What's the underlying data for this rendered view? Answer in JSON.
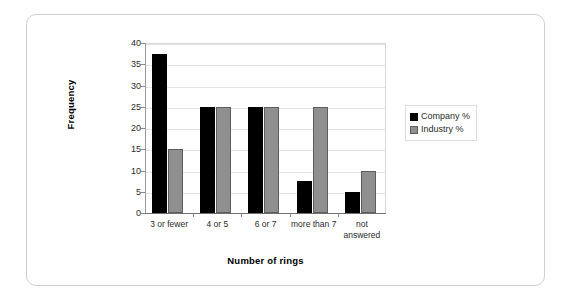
{
  "chart_data": {
    "type": "bar",
    "title": "",
    "xlabel": "Number of rings",
    "ylabel": "Frequency",
    "categories": [
      "3 or fewer",
      "4 or 5",
      "6 or 7",
      "more than 7",
      "not answered"
    ],
    "series": [
      {
        "name": "Company %",
        "color": "#000000",
        "values": [
          37.5,
          25,
          25,
          7.5,
          5
        ]
      },
      {
        "name": "Industry %",
        "color": "#8f8f8f",
        "values": [
          15,
          25,
          25,
          25,
          10
        ]
      }
    ],
    "ylim": [
      0,
      40
    ],
    "ytick_step": 5,
    "ytick_labels": [
      "0",
      "5",
      "10",
      "15",
      "20",
      "25",
      "30",
      "35",
      "40"
    ],
    "grid": true,
    "legend_position": "right"
  },
  "legend": {
    "items": [
      {
        "label": "Company %"
      },
      {
        "label": "Industry %"
      }
    ]
  },
  "axes": {
    "y_title": "Frequency",
    "x_title": "Number of rings"
  }
}
